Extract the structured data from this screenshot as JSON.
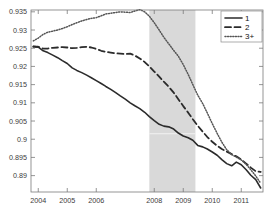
{
  "chart_data": {
    "type": "line",
    "title": "",
    "xlabel": "",
    "ylabel": "",
    "xlim": [
      2003.75,
      2011.75
    ],
    "ylim": [
      0.8855,
      0.9355
    ],
    "grid": false,
    "legend_position": "top-right",
    "xticks": [
      2004,
      2005,
      2006,
      2008,
      2009,
      2010,
      2011
    ],
    "xtick_labels": [
      "2004",
      "2005",
      "2006",
      "2008",
      "2009",
      "2010",
      "2011"
    ],
    "yticks": [
      0.89,
      0.895,
      0.9,
      0.905,
      0.91,
      0.915,
      0.92,
      0.925,
      0.93,
      0.935
    ],
    "ytick_labels": [
      "0.89",
      "0.895",
      "0.9",
      "0.905",
      "0.91",
      "0.915",
      "0.92",
      "0.925",
      "0.93",
      "0.935"
    ],
    "shaded_regions": [
      {
        "name": "recession-band",
        "x0": 2007.83,
        "x1": 2009.42,
        "color": "#d9d9d9"
      }
    ],
    "x": [
      2003.83,
      2004.0,
      2004.17,
      2004.33,
      2004.5,
      2004.67,
      2004.83,
      2005.0,
      2005.17,
      2005.33,
      2005.5,
      2005.67,
      2005.83,
      2006.0,
      2006.17,
      2006.33,
      2006.5,
      2006.67,
      2006.83,
      2007.0,
      2007.17,
      2007.33,
      2007.5,
      2007.67,
      2007.83,
      2008.0,
      2008.17,
      2008.33,
      2008.5,
      2008.67,
      2008.83,
      2009.0,
      2009.17,
      2009.33,
      2009.5,
      2009.67,
      2009.83,
      2010.0,
      2010.17,
      2010.33,
      2010.5,
      2010.67,
      2010.83,
      2011.0,
      2011.17,
      2011.33,
      2011.5,
      2011.67
    ],
    "series": [
      {
        "name": "1",
        "label": "1",
        "style": "solid",
        "color": "#2b2b2b",
        "values": [
          0.9255,
          0.9253,
          0.9243,
          0.9238,
          0.9231,
          0.9224,
          0.9216,
          0.9208,
          0.9196,
          0.9189,
          0.9183,
          0.9176,
          0.9169,
          0.9161,
          0.9153,
          0.9145,
          0.9137,
          0.9128,
          0.9119,
          0.911,
          0.91,
          0.9092,
          0.9084,
          0.9074,
          0.9062,
          0.9051,
          0.9041,
          0.9036,
          0.9034,
          0.9028,
          0.9017,
          0.9009,
          0.9004,
          0.8997,
          0.8983,
          0.8979,
          0.8973,
          0.8965,
          0.8956,
          0.8944,
          0.8933,
          0.8927,
          0.8937,
          0.893,
          0.8916,
          0.8901,
          0.8889,
          0.8866
        ]
      },
      {
        "name": "2",
        "label": "2",
        "style": "dashed",
        "color": "#2b2b2b",
        "values": [
          0.9254,
          0.9254,
          0.9249,
          0.9249,
          0.9251,
          0.9252,
          0.9253,
          0.9252,
          0.925,
          0.9251,
          0.9253,
          0.9254,
          0.9252,
          0.9248,
          0.9243,
          0.924,
          0.9238,
          0.9236,
          0.9235,
          0.9234,
          0.9235,
          0.923,
          0.9222,
          0.9212,
          0.92,
          0.9186,
          0.9172,
          0.9158,
          0.9144,
          0.9128,
          0.911,
          0.9091,
          0.9073,
          0.9055,
          0.9037,
          0.9021,
          0.9006,
          0.8993,
          0.8982,
          0.8973,
          0.8966,
          0.8959,
          0.8953,
          0.8944,
          0.8933,
          0.8922,
          0.8912,
          0.891
        ]
      },
      {
        "name": "3+",
        "label": "3+",
        "style": "dotted",
        "color": "#555555",
        "values": [
          0.927,
          0.9278,
          0.9288,
          0.9294,
          0.9297,
          0.93,
          0.9304,
          0.9309,
          0.9315,
          0.932,
          0.9325,
          0.9329,
          0.9332,
          0.9334,
          0.9339,
          0.9344,
          0.9346,
          0.9348,
          0.935,
          0.9349,
          0.9348,
          0.9352,
          0.9356,
          0.935,
          0.9338,
          0.932,
          0.93,
          0.928,
          0.9262,
          0.9244,
          0.9228,
          0.9205,
          0.9178,
          0.915,
          0.9121,
          0.9098,
          0.9072,
          0.9043,
          0.9016,
          0.8992,
          0.8971,
          0.8958,
          0.8951,
          0.8943,
          0.8931,
          0.8916,
          0.8899,
          0.8879
        ]
      }
    ]
  },
  "legend": {
    "entries": [
      {
        "label": "1",
        "style": "solid"
      },
      {
        "label": "2",
        "style": "dashed"
      },
      {
        "label": "3+",
        "style": "dotted"
      }
    ]
  }
}
